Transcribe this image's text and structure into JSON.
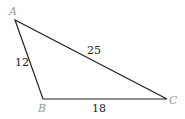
{
  "diagram": {
    "type": "triangle",
    "vertices": [
      {
        "name": "A",
        "x": 15,
        "y": 20
      },
      {
        "name": "B",
        "x": 43,
        "y": 99
      },
      {
        "name": "C",
        "x": 167,
        "y": 99
      }
    ],
    "sides": [
      {
        "between": "AB",
        "length": "12"
      },
      {
        "between": "AC",
        "length": "25"
      },
      {
        "between": "BC",
        "length": "18"
      }
    ],
    "colors": {
      "stroke": "#222222",
      "vertex_label": "#9a9a9a",
      "side_label": "#222222"
    }
  }
}
